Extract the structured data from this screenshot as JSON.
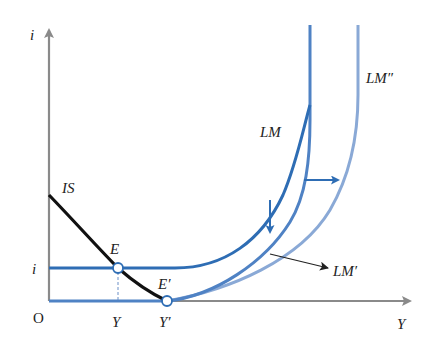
{
  "axes": {
    "y_label": "i",
    "x_label": "Y",
    "origin_label": "O"
  },
  "curves": {
    "is": {
      "label": "IS",
      "color": "#111111"
    },
    "lm": {
      "label": "LM",
      "color": "#2e6db4"
    },
    "lm_prime": {
      "label": "LM′",
      "color": "#4f82c4"
    },
    "lm_double_prime": {
      "label": "LM″",
      "color": "#8aa9d6"
    }
  },
  "points": {
    "e": {
      "label": "E"
    },
    "e_prime": {
      "label": "E′"
    }
  },
  "tick_labels": {
    "i_level": "i",
    "y_eq": "Y",
    "y_eq_prime": "Y′"
  },
  "colors": {
    "axis": "#8a8a8a",
    "arrow_blue": "#2e6db4",
    "annotation": "#222222"
  }
}
